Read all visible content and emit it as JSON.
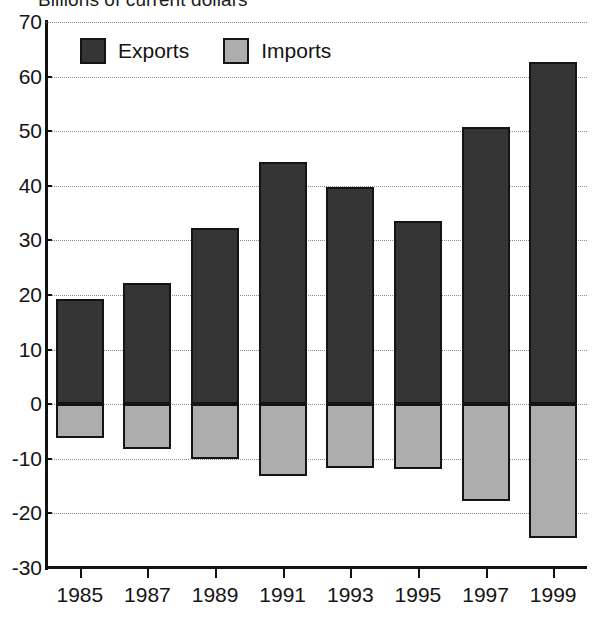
{
  "chart_data": {
    "type": "bar",
    "title": "Billions of current dollars",
    "xlabel": "",
    "ylabel": "",
    "ylim": [
      -30,
      70
    ],
    "ytick_step": 10,
    "yticks": [
      "70",
      "60",
      "50",
      "40",
      "30",
      "20",
      "10",
      "0",
      "-10",
      "-20",
      "-30"
    ],
    "grid": true,
    "legend_position": "top-left",
    "categories": [
      "1985",
      "1987",
      "1989",
      "1991",
      "1993",
      "1995",
      "1997",
      "1999"
    ],
    "series": [
      {
        "name": "Exports",
        "color": "#353535",
        "values": [
          19.3,
          22.2,
          32.2,
          44.4,
          39.8,
          33.6,
          50.7,
          62.6
        ]
      },
      {
        "name": "Imports",
        "color": "#adadad",
        "values": [
          -6.2,
          -8.2,
          -10.0,
          -13.2,
          -11.7,
          -11.8,
          -17.8,
          -24.5
        ]
      }
    ]
  },
  "legend": {
    "items": [
      {
        "label": "Exports",
        "swatch": "dark-square-icon"
      },
      {
        "label": "Imports",
        "swatch": "gray-square-icon"
      }
    ]
  }
}
